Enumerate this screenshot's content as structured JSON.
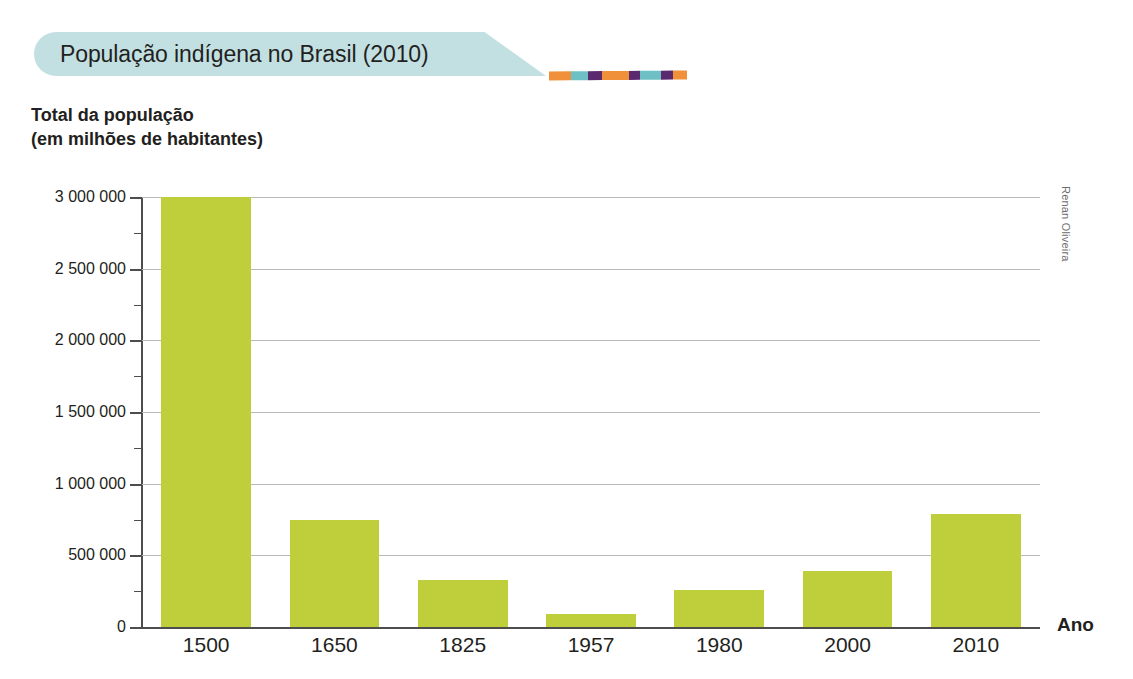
{
  "banner": {
    "title": "População indígena no Brasil (2010)",
    "background_color": "#c2e0e2"
  },
  "decorative_rule": {
    "name": "striped-rule",
    "segments": [
      {
        "color": "#f0903a",
        "width": 22
      },
      {
        "color": "#6fc0c4",
        "width": 17
      },
      {
        "color": "#5b2a6e",
        "width": 14
      },
      {
        "color": "#f0903a",
        "width": 27
      },
      {
        "color": "#5b2a6e",
        "width": 11
      },
      {
        "color": "#6fc0c4",
        "width": 21
      },
      {
        "color": "#5b2a6e",
        "width": 12
      },
      {
        "color": "#f0903a",
        "width": 14
      }
    ]
  },
  "credit": "Renan Oliveira",
  "chart_data": {
    "type": "bar",
    "title": "População indígena no Brasil (2010)",
    "subtitle": "",
    "ylabel": "Total da população\n(em milhões de habitantes)",
    "xlabel": "Ano",
    "categories": [
      "1500",
      "1650",
      "1825",
      "1957",
      "1980",
      "2000",
      "2010"
    ],
    "values": [
      3000000,
      750000,
      330000,
      90000,
      260000,
      390000,
      790000
    ],
    "series": [
      {
        "name": "Total da população",
        "color": "#bfcf3c",
        "values": [
          3000000,
          750000,
          330000,
          90000,
          260000,
          390000,
          790000
        ]
      }
    ],
    "ylim": [
      0,
      3000000
    ],
    "ytick_values": [
      0,
      500000,
      1000000,
      1500000,
      2000000,
      2500000,
      3000000
    ],
    "ytick_labels": [
      "0",
      "500 000",
      "1 000 000",
      "1 500 000",
      "2 000 000",
      "2 500 000",
      "3 000 000"
    ],
    "grid": true,
    "grid_axis": "y",
    "legend": false,
    "legend_position": "none",
    "bar_color": "#bfcf3c"
  }
}
